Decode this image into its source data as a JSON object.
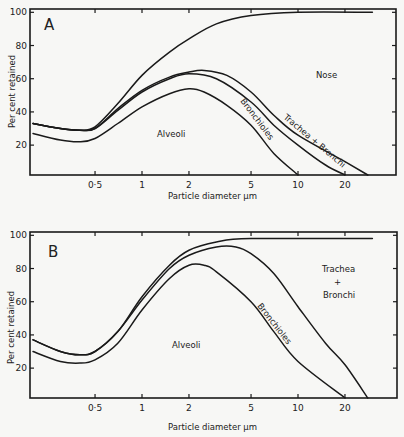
{
  "chart_data": [
    {
      "type": "line",
      "panel": "A",
      "title": "A",
      "xlabel": "Particle diameter µm",
      "ylabel": "Per cent retained",
      "xscale": "log",
      "xlim": [
        0.2,
        30
      ],
      "ylim": [
        0,
        100
      ],
      "x_ticks": [
        0.5,
        1,
        2,
        5,
        10,
        20
      ],
      "x_tick_labels": [
        "0·5",
        "1",
        "2",
        "5",
        "10",
        "20"
      ],
      "y_ticks": [
        20,
        40,
        60,
        80,
        100
      ],
      "y_tick_labels": [
        "20",
        "40",
        "60",
        "80",
        "100"
      ],
      "region_labels": [
        "Nose",
        "Trachea + Bronchi",
        "Bronchioles",
        "Alveoli"
      ],
      "series": [
        {
          "name": "Nose (total)",
          "x": [
            0.2,
            0.3,
            0.4,
            0.5,
            0.7,
            1,
            1.5,
            2,
            3,
            5,
            10,
            30
          ],
          "values": [
            33,
            30,
            29,
            31,
            45,
            62,
            76,
            84,
            93,
            98,
            100,
            100
          ]
        },
        {
          "name": "Trachea + Bronchi",
          "x": [
            0.2,
            0.3,
            0.4,
            0.5,
            0.7,
            1,
            1.5,
            2,
            2.5,
            3.5,
            5,
            7,
            10,
            20,
            28
          ],
          "values": [
            33,
            30,
            29,
            30,
            42,
            53,
            61,
            64,
            65,
            62,
            52,
            38,
            26,
            10,
            0
          ]
        },
        {
          "name": "Bronchioles",
          "x": [
            0.2,
            0.3,
            0.4,
            0.5,
            0.7,
            1,
            1.5,
            2,
            3,
            5,
            7,
            10,
            15,
            20
          ],
          "values": [
            33,
            30,
            29,
            30,
            41,
            52,
            60,
            63,
            60,
            46,
            32,
            20,
            8,
            0
          ]
        },
        {
          "name": "Alveoli",
          "x": [
            0.2,
            0.3,
            0.4,
            0.5,
            0.7,
            1,
            1.5,
            2,
            2.5,
            3.5,
            5,
            7,
            10
          ],
          "values": [
            27,
            23,
            22,
            24,
            33,
            43,
            51,
            54,
            52,
            44,
            32,
            15,
            0
          ]
        }
      ]
    },
    {
      "type": "line",
      "panel": "B",
      "title": "B",
      "xlabel": "Particle diameter µm",
      "ylabel": "Per cent retained",
      "xscale": "log",
      "xlim": [
        0.2,
        30
      ],
      "ylim": [
        0,
        100
      ],
      "x_ticks": [
        0.5,
        1,
        2,
        5,
        10,
        20
      ],
      "x_tick_labels": [
        "0·5",
        "1",
        "2",
        "5",
        "10",
        "20"
      ],
      "y_ticks": [
        20,
        40,
        60,
        80,
        100
      ],
      "y_tick_labels": [
        "20",
        "40",
        "60",
        "80",
        "100"
      ],
      "region_labels": [
        "Trachea + Bronchi",
        "Bronchioles",
        "Alveoli"
      ],
      "series": [
        {
          "name": "Trachea + Bronchi (total)",
          "x": [
            0.2,
            0.3,
            0.4,
            0.5,
            0.7,
            1,
            1.5,
            2,
            3,
            5,
            30
          ],
          "values": [
            37,
            30,
            28,
            30,
            42,
            63,
            82,
            91,
            96,
            98,
            98
          ]
        },
        {
          "name": "Bronchioles",
          "x": [
            0.2,
            0.3,
            0.4,
            0.5,
            0.7,
            1,
            1.5,
            2,
            3,
            4,
            5,
            7,
            10,
            15,
            20,
            28
          ],
          "values": [
            37,
            30,
            28,
            30,
            42,
            61,
            80,
            88,
            93,
            93,
            89,
            77,
            57,
            35,
            22,
            0
          ]
        },
        {
          "name": "Alveoli",
          "x": [
            0.2,
            0.3,
            0.4,
            0.5,
            0.7,
            1,
            1.5,
            2,
            2.5,
            3,
            5,
            7,
            10,
            20
          ],
          "values": [
            30,
            24,
            23,
            25,
            35,
            55,
            74,
            82,
            82,
            78,
            60,
            42,
            24,
            0
          ]
        }
      ]
    }
  ],
  "panels": {
    "A": {
      "letter": "A",
      "nose": "Nose",
      "tb": "Trachea + Bronchi",
      "bronchioles": "Bronchioles",
      "alveoli": "Alveoli"
    },
    "B": {
      "letter": "B",
      "tb_line1": "Trachea",
      "tb_line2": "+",
      "tb_line3": "Bronchi",
      "bronchioles": "Bronchioles",
      "alveoli": "Alveoli"
    }
  },
  "axis": {
    "xlabel": "Particle  diameter  µm",
    "ylabel": "Per  cent  retained"
  }
}
